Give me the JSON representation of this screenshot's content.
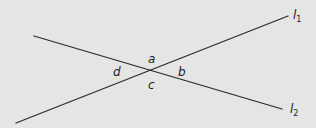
{
  "diagram": {
    "type": "intersecting-lines",
    "background": "#e5e5e3",
    "line_color": "#2a2a2a",
    "lines": [
      {
        "id": "l1",
        "name": "l",
        "subscript": "1",
        "x1": 16,
        "y1": 123,
        "x2": 288,
        "y2": 16,
        "label_x": 293,
        "label_y": 19
      },
      {
        "id": "l2",
        "name": "l",
        "subscript": "2",
        "x1": 34,
        "y1": 36,
        "x2": 282,
        "y2": 109,
        "label_x": 290,
        "label_y": 113
      }
    ],
    "intersection": {
      "x": 151,
      "y": 70
    },
    "angles": [
      {
        "label": "a",
        "x": 148,
        "y": 63
      },
      {
        "label": "b",
        "x": 178,
        "y": 76
      },
      {
        "label": "c",
        "x": 148,
        "y": 89
      },
      {
        "label": "d",
        "x": 113,
        "y": 76
      }
    ]
  }
}
